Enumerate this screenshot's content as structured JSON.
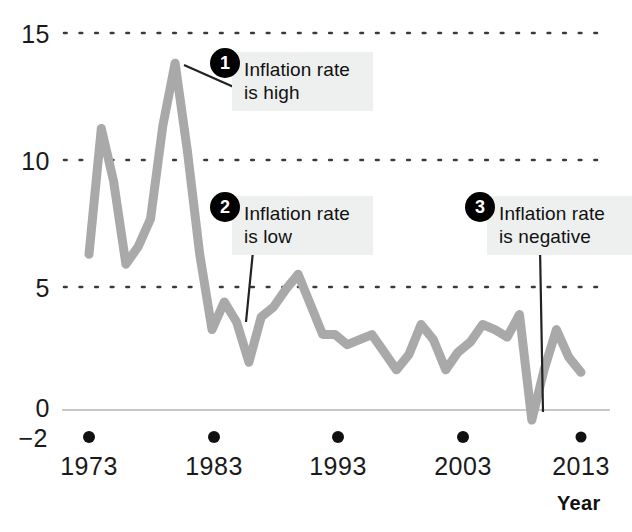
{
  "chart_data": {
    "type": "line",
    "title": "",
    "xlabel": "Year",
    "ylabel": "",
    "xlim": [
      1973,
      2013
    ],
    "ylim": [
      -2,
      15
    ],
    "grid": "dotted horizontal gridlines at 5, 10, 15; solid zero line at 0",
    "legend": "none",
    "line_color": "#a9a9a9",
    "zero_line_color": "#c8c8c8",
    "x_tick_labels": [
      "1973",
      "1983",
      "1993",
      "2003",
      "2013"
    ],
    "x_tick_values": [
      1973,
      1983,
      1993,
      2003,
      2013
    ],
    "y_tick_labels": [
      "15",
      "10",
      "5",
      "0",
      "-2"
    ],
    "y_tick_values": [
      15,
      10,
      5,
      0,
      -2
    ],
    "series": [
      {
        "name": "Inflation rate",
        "x": [
          1973,
          1974,
          1975,
          1976,
          1977,
          1978,
          1979,
          1980,
          1981,
          1982,
          1983,
          1984,
          1985,
          1986,
          1987,
          1988,
          1989,
          1990,
          1991,
          1992,
          1993,
          1994,
          1995,
          1996,
          1997,
          1998,
          1999,
          2000,
          2001,
          2002,
          2003,
          2004,
          2005,
          2006,
          2007,
          2008,
          2009,
          2010,
          2011,
          2012,
          2013
        ],
        "values": [
          6.2,
          11.2,
          9.1,
          5.8,
          6.5,
          7.6,
          11.3,
          13.8,
          10.3,
          6.2,
          3.2,
          4.3,
          3.5,
          1.9,
          3.7,
          4.1,
          4.8,
          5.4,
          4.2,
          3.0,
          3.0,
          2.6,
          2.8,
          3.0,
          2.3,
          1.6,
          2.2,
          3.4,
          2.8,
          1.6,
          2.3,
          2.7,
          3.4,
          3.2,
          2.9,
          3.8,
          -0.4,
          1.6,
          3.2,
          2.1,
          1.5
        ]
      }
    ],
    "annotations": [
      {
        "number": "1",
        "text": "Inflation rate\nis high",
        "points_to_year": 1980,
        "points_to_value": 13.8
      },
      {
        "number": "2",
        "text": "Inflation rate\nis low",
        "points_to_year": 1986,
        "points_to_value": 1.9
      },
      {
        "number": "3",
        "text": "Inflation rate\nis negative",
        "points_to_year": 2009,
        "points_to_value": -0.4
      }
    ]
  },
  "axes": {
    "y_labels": [
      {
        "text": "15",
        "top": 20
      },
      {
        "text": "10",
        "top": 147
      },
      {
        "text": "5",
        "top": 274
      },
      {
        "text": "0",
        "top": 394
      },
      {
        "text": "-2",
        "text_display": "−2",
        "top": 424
      }
    ],
    "x_labels": [
      {
        "text": "1973",
        "left": 44
      },
      {
        "text": "1983",
        "left": 169
      },
      {
        "text": "1993",
        "left": 293
      },
      {
        "text": "2003",
        "left": 418
      },
      {
        "text": "2013",
        "left": 536
      }
    ],
    "x_axis_title": "Year"
  },
  "callouts": [
    {
      "number": "1",
      "line1": "Inflation rate",
      "line2": "is high"
    },
    {
      "number": "2",
      "line1": "Inflation rate",
      "line2": "is low"
    },
    {
      "number": "3",
      "line1": "Inflation rate",
      "line2": "is negative"
    }
  ]
}
